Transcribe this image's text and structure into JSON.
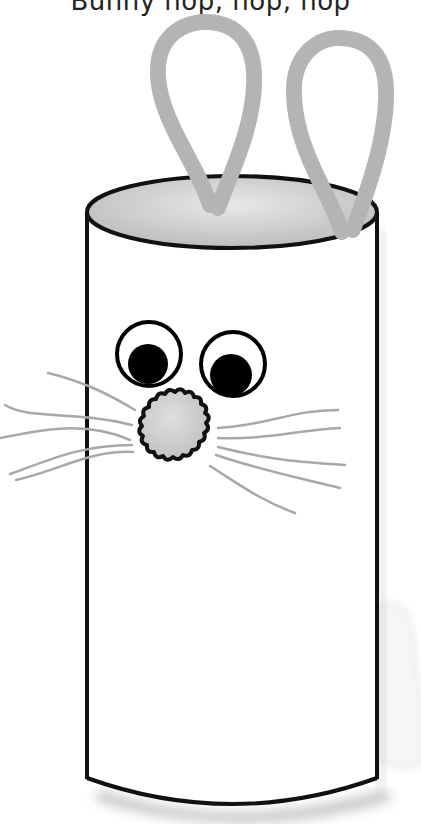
{
  "caption": {
    "text": "Bunny hop, hop, hop"
  },
  "illustration": {
    "subject": "paper-tube-bunny",
    "colors": {
      "outline": "#111111",
      "pipe_cleaner": "#b4b4b4",
      "tube_top_inner": "#d2d2d2",
      "nose_pompom": "#cfcfcf",
      "whisker": "#a8a8a8",
      "pupil": "#000000",
      "shadow": "#9a9a9a",
      "background": "#ffffff"
    },
    "parts": {
      "ears": [
        "left-ear",
        "right-ear"
      ],
      "eyes": [
        "left-eye",
        "right-eye"
      ],
      "nose": "pompom-nose",
      "whiskers_left": 5,
      "whiskers_right": 5
    }
  }
}
